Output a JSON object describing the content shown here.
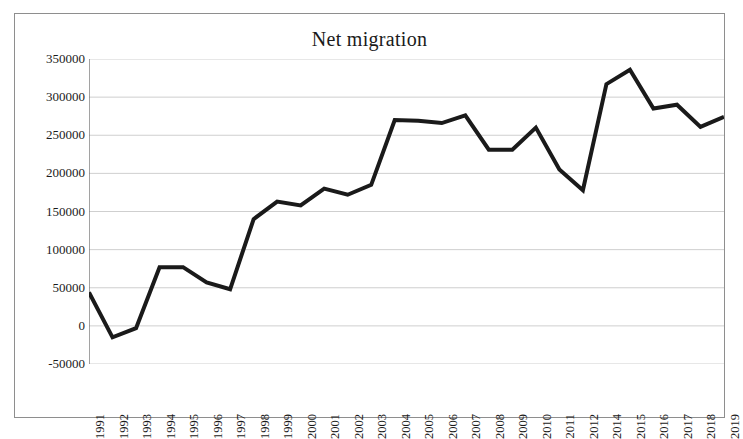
{
  "chart_data": {
    "type": "line",
    "title": "Net migration",
    "xlabel": "",
    "ylabel": "",
    "ylim": [
      -50000,
      350000
    ],
    "ytick_step": 50000,
    "yticks": [
      350000,
      300000,
      250000,
      200000,
      150000,
      100000,
      50000,
      0,
      -50000
    ],
    "ytick_labels": [
      "350000",
      "300000",
      "250000",
      "200000",
      "150000",
      "100000",
      "50000",
      "0",
      "-50000"
    ],
    "grid": true,
    "grid_axis": "y",
    "legend": false,
    "legend_position": "none",
    "line_color": "#1a1a1a",
    "line_width_px": 4,
    "categories": [
      "1991",
      "1992",
      "1993",
      "1994",
      "1995",
      "1996",
      "1997",
      "1998",
      "1999",
      "2000",
      "2001",
      "2002",
      "2003",
      "2004",
      "2005",
      "2006",
      "2007",
      "2008",
      "2009",
      "2010",
      "2011",
      "2012",
      "2014",
      "2015",
      "2016",
      "2017",
      "2018",
      "2019"
    ],
    "values": [
      44000,
      -15000,
      -3000,
      77000,
      77000,
      57000,
      48000,
      140000,
      163000,
      158000,
      180000,
      172000,
      185000,
      270000,
      269000,
      266000,
      276000,
      231000,
      231000,
      260000,
      205000,
      178000,
      317000,
      336000,
      285000,
      290000,
      261000,
      274000
    ],
    "series": [
      {
        "name": "Net migration",
        "values": [
          44000,
          -15000,
          -3000,
          77000,
          77000,
          57000,
          48000,
          140000,
          163000,
          158000,
          180000,
          172000,
          185000,
          270000,
          269000,
          266000,
          276000,
          231000,
          231000,
          260000,
          205000,
          178000,
          317000,
          336000,
          285000,
          290000,
          261000,
          274000
        ]
      }
    ],
    "annotations": []
  },
  "figure": {
    "title": "Net migration",
    "border_color": "#8e8e8e",
    "background": "#ffffff",
    "gridline_color": "#c9c9c9",
    "axis_color": "#7a7a7a"
  }
}
